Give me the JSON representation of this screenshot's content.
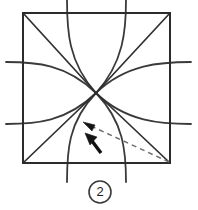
{
  "figure": {
    "step_label": "2",
    "colors": {
      "ink": "#2b2b2b",
      "curve": "#3a3a3a",
      "dashed_fold": "#6e6e6e",
      "arrow": "#111111",
      "background": "#ffffff"
    },
    "square": {
      "left": 23,
      "top": 13,
      "right": 170,
      "bottom": 163,
      "width": 147,
      "height": 150
    },
    "center_point": {
      "x": 96,
      "y": 93
    },
    "diagonals": [
      {
        "name": "diagonal-top-left-to-center",
        "x1": 23,
        "y1": 13,
        "x2": 96,
        "y2": 93
      },
      {
        "name": "diagonal-top-right-to-center",
        "x1": 170,
        "y1": 13,
        "x2": 96,
        "y2": 93
      },
      {
        "name": "diagonal-bottom-left-to-center",
        "x1": 23,
        "y1": 163,
        "x2": 96,
        "y2": 93
      },
      {
        "name": "diagonal-bottom-right-to-center",
        "x1": 170,
        "y1": 163,
        "x2": 96,
        "y2": 93
      }
    ],
    "arcs": [
      {
        "name": "arc-upper-left",
        "start_x": 67,
        "start_y": 0,
        "end_x": 96,
        "end_y": 93,
        "ctrl_x": 72,
        "ctrl_y": 62
      },
      {
        "name": "arc-upper-right",
        "start_x": 126,
        "start_y": 0,
        "end_x": 96,
        "end_y": 93,
        "ctrl_x": 122,
        "ctrl_y": 62
      },
      {
        "name": "arc-lower-left",
        "start_x": 67,
        "start_y": 182,
        "end_x": 96,
        "end_y": 93,
        "ctrl_x": 72,
        "ctrl_y": 126
      },
      {
        "name": "arc-lower-right",
        "start_x": 126,
        "start_y": 182,
        "end_x": 96,
        "end_y": 93,
        "ctrl_x": 122,
        "ctrl_y": 126
      },
      {
        "name": "arc-left-upper",
        "start_x": 7,
        "start_y": 62,
        "end_x": 96,
        "end_y": 93,
        "ctrl_x": 60,
        "ctrl_y": 68
      },
      {
        "name": "arc-left-lower",
        "start_x": 7,
        "start_y": 124,
        "end_x": 96,
        "end_y": 93,
        "ctrl_x": 60,
        "ctrl_y": 118
      },
      {
        "name": "arc-right-upper",
        "start_x": 190,
        "start_y": 62,
        "end_x": 96,
        "end_y": 93,
        "ctrl_x": 134,
        "ctrl_y": 68
      },
      {
        "name": "arc-right-lower",
        "start_x": 190,
        "start_y": 124,
        "end_x": 96,
        "end_y": 93,
        "ctrl_x": 134,
        "ctrl_y": 118
      }
    ],
    "fold_arrow": {
      "name": "fold-direction-arrow",
      "from_x": 170,
      "from_y": 163,
      "to_x": 86,
      "to_y": 124,
      "style": "dashed",
      "arrowhead": "at-end"
    },
    "pointer_arrow": {
      "name": "emphasis-pointer-arrow",
      "tail_x": 101,
      "tail_y": 153,
      "tip_x": 87,
      "tip_y": 135
    },
    "step_badge": {
      "center_x": 100,
      "center_y": 192,
      "radius": 11
    }
  }
}
